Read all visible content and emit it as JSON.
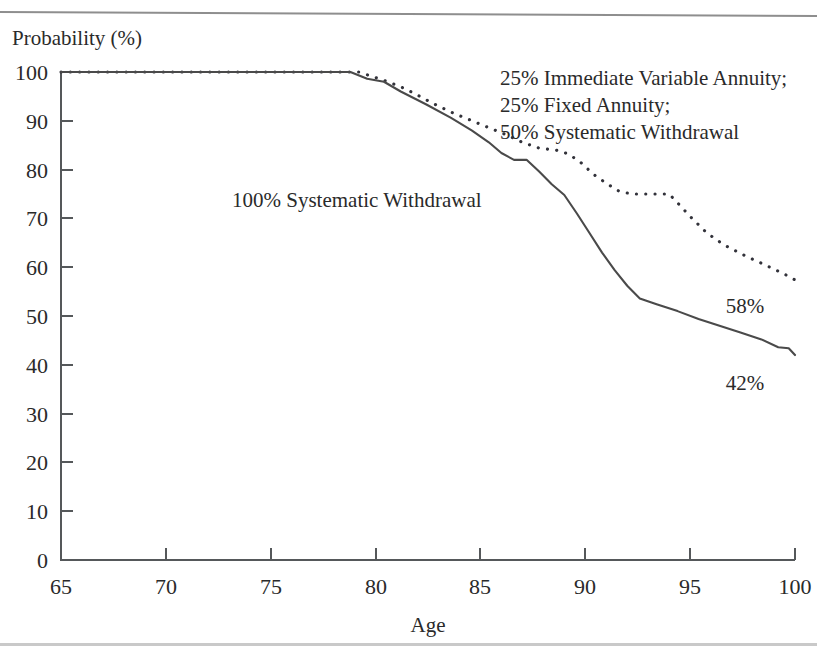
{
  "chart_data": {
    "type": "line",
    "title": "",
    "ylabel": "Probability (%)",
    "xlabel": "Age",
    "xlim": [
      65,
      100
    ],
    "ylim": [
      0,
      100
    ],
    "xticks": [
      65,
      70,
      75,
      80,
      85,
      90,
      95,
      100
    ],
    "yticks": [
      0,
      10,
      20,
      30,
      40,
      50,
      60,
      70,
      80,
      90,
      100
    ],
    "grid": false,
    "legend": "inline-annotations",
    "series": [
      {
        "name": "100% Systematic Withdrawal",
        "style": "solid",
        "label_text": "100% Systematic Withdrawal",
        "end_label": "42%",
        "end_value": 42,
        "x": [
          65,
          70,
          75,
          78.8,
          79.6,
          80.4,
          81.2,
          82.4,
          83.6,
          84.6,
          85.4,
          86.0,
          86.6,
          87.2,
          87.8,
          88.4,
          89.0,
          89.6,
          90.2,
          90.8,
          91.4,
          92.0,
          92.6,
          93.4,
          94.4,
          95.4,
          96.4,
          97.4,
          98.4,
          99.2,
          99.7,
          100
        ],
        "y": [
          100,
          100,
          100,
          100,
          98.6,
          98.0,
          96.0,
          93.4,
          90.6,
          88.0,
          85.6,
          83.4,
          82.0,
          82.0,
          79.6,
          77.0,
          74.8,
          71.0,
          67.0,
          63.0,
          59.4,
          56.2,
          53.6,
          52.4,
          51.0,
          49.4,
          48.0,
          46.6,
          45.2,
          43.6,
          43.4,
          42.0
        ]
      },
      {
        "name": "25% Immediate Variable Annuity; 25% Fixed Annuity; 50% Systematic Withdrawal",
        "style": "dotted",
        "label_lines": [
          "25% Immediate Variable Annuity;",
          "25% Fixed Annuity;",
          "50% Systematic Withdrawal"
        ],
        "end_label": "58%",
        "end_value": 58,
        "x": [
          65,
          70,
          75,
          79.2,
          79.9,
          80.6,
          81.4,
          82.2,
          83.0,
          83.8,
          84.6,
          85.4,
          86.2,
          87.0,
          87.8,
          88.6,
          89.2,
          89.8,
          90.4,
          91.0,
          91.6,
          92.2,
          92.8,
          93.4,
          94.0,
          94.4,
          95.0,
          95.8,
          96.6,
          97.6,
          98.6,
          99.4,
          100
        ],
        "y": [
          100,
          100,
          100,
          100,
          99.0,
          98.0,
          96.6,
          94.8,
          93.0,
          91.4,
          90.0,
          88.6,
          87.2,
          85.6,
          84.4,
          84.0,
          83.2,
          81.4,
          79.0,
          77.2,
          75.6,
          75.0,
          75.0,
          75.0,
          75.0,
          73.2,
          70.4,
          67.0,
          64.6,
          62.4,
          60.4,
          58.8,
          57.4
        ]
      }
    ],
    "annotations": [
      {
        "name": "solid-series-label",
        "text": "100% Systematic Withdrawal",
        "x_px": 232,
        "y_px": 207
      },
      {
        "name": "dotted-series-label-line-1",
        "text": "25% Immediate Variable Annuity;",
        "x_px": 500,
        "y_px": 85
      },
      {
        "name": "dotted-series-label-line-2",
        "text": "25% Fixed Annuity;",
        "x_px": 500,
        "y_px": 112
      },
      {
        "name": "dotted-series-label-line-3",
        "text": "50% Systematic Withdrawal",
        "x_px": 500,
        "y_px": 139
      },
      {
        "name": "dotted-end-value-label",
        "text": "58%",
        "x_px": 745,
        "y_px": 313
      },
      {
        "name": "solid-end-value-label",
        "text": "42%",
        "x_px": 745,
        "y_px": 390
      }
    ]
  },
  "axes": {
    "y_axis_title": "Probability (%)",
    "x_axis_title": "Age",
    "x_tick_labels": [
      "65",
      "70",
      "75",
      "80",
      "85",
      "90",
      "95",
      "100"
    ],
    "y_tick_labels": [
      "100",
      "90",
      "80",
      "70",
      "60",
      "50",
      "40",
      "30",
      "20",
      "10",
      "0"
    ]
  },
  "colors": {
    "axis": "#55585a",
    "solid_series": "#4a4a4a",
    "dotted_series": "#32323a",
    "text": "#2a2a2a",
    "background": "#ffffff",
    "rule": "#8e8e8e"
  }
}
